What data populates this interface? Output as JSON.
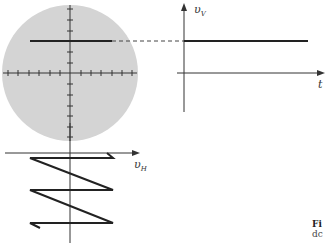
{
  "figure": {
    "colors": {
      "screen_fill": "#d4d4d4",
      "trace": "#222222",
      "axis": "#333333"
    },
    "labels": {
      "vertical_voltage": "υ",
      "vertical_voltage_sub": "V",
      "time": "t",
      "horizontal_voltage": "υ",
      "horizontal_voltage_sub": "H"
    },
    "caption": {
      "line1": "Fi",
      "line2": "dc"
    }
  }
}
